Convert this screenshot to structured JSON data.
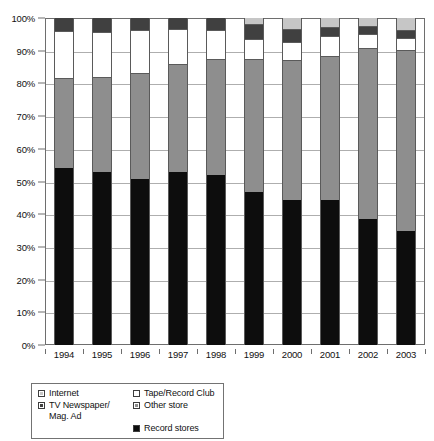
{
  "chart_data": {
    "type": "bar",
    "subtype": "stacked-percentage",
    "title": "",
    "xlabel": "",
    "ylabel": "",
    "ylim": [
      0,
      100
    ],
    "ytick_labels": [
      "100%",
      "90%",
      "80%",
      "70%",
      "60%",
      "50%",
      "40%",
      "30%",
      "20%",
      "10%",
      "0%"
    ],
    "ytick_values": [
      100,
      90,
      80,
      70,
      60,
      50,
      40,
      30,
      20,
      10,
      0
    ],
    "grid": true,
    "legend_position": "below-left",
    "categories": [
      "1994",
      "1995",
      "1996",
      "1997",
      "1998",
      "1999",
      "2000",
      "2001",
      "2002",
      "2003"
    ],
    "series": [
      {
        "name": "Record stores",
        "color": "#0d0d0d",
        "values": [
          54.2,
          53.0,
          50.8,
          52.9,
          52.1,
          46.9,
          44.4,
          44.3,
          38.5,
          35.0
        ]
      },
      {
        "name": "Other store",
        "color": "#8e8e8e",
        "values": [
          27.1,
          28.7,
          32.0,
          32.6,
          35.1,
          40.2,
          42.4,
          43.9,
          52.1,
          55.0
        ]
      },
      {
        "name": "Tape/Record Club",
        "color": "#ffffff",
        "values": [
          14.7,
          14.1,
          13.4,
          11.0,
          9.2,
          6.4,
          5.8,
          6.3,
          4.6,
          4.0
        ]
      },
      {
        "name": "TV Newspaper/Mag. Ad",
        "color": "#404040",
        "values": [
          4.0,
          4.2,
          3.8,
          3.5,
          3.6,
          4.4,
          3.6,
          2.5,
          2.1,
          2.0
        ]
      },
      {
        "name": "Internet",
        "color": "#c6c6c6",
        "values": [
          0.0,
          0.0,
          0.0,
          0.0,
          0.0,
          2.1,
          3.8,
          3.0,
          2.7,
          4.0
        ]
      }
    ]
  },
  "legend": {
    "entries": [
      {
        "label": "Internet",
        "key": "internet"
      },
      {
        "label": "Tape/Record Club",
        "key": "tape"
      },
      {
        "label": "TV Newspaper/\nMag. Ad",
        "key": "tv"
      },
      {
        "label": "Other store",
        "key": "other"
      },
      {
        "label": "Record stores",
        "key": "record"
      }
    ]
  },
  "colors": {
    "internet": "#c6c6c6",
    "tv_newspaper": "#404040",
    "tape_record_club": "#ffffff",
    "other_store": "#8e8e8e",
    "record_stores": "#0d0d0d",
    "gridline": "#aeaeae",
    "axis": "#6e6e6e"
  }
}
